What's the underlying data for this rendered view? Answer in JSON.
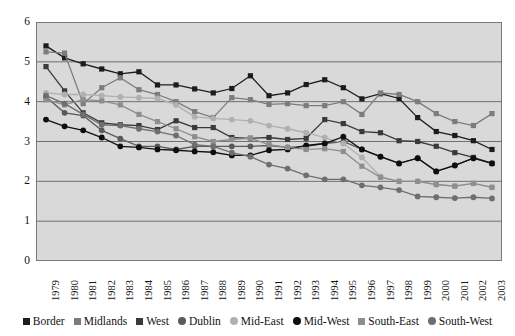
{
  "chart_data": {
    "type": "line",
    "title": "",
    "xlabel": "",
    "ylabel": "",
    "ylim": [
      0,
      6
    ],
    "yticks": [
      0,
      1,
      2,
      3,
      4,
      5,
      6
    ],
    "grid": true,
    "legend_position": "bottom",
    "x": [
      1979,
      1980,
      1981,
      1982,
      1983,
      1984,
      1985,
      1986,
      1987,
      1988,
      1989,
      1990,
      1991,
      1992,
      1993,
      1994,
      1995,
      1996,
      1997,
      1998,
      1999,
      2000,
      2001,
      2002,
      2003
    ],
    "categories": [
      "1979",
      "1980",
      "1981",
      "1982",
      "1983",
      "1984",
      "1985",
      "1986",
      "1987",
      "1988",
      "1989",
      "1990",
      "1991",
      "1992",
      "1993",
      "1994",
      "1995",
      "1996",
      "1997",
      "1998",
      "1999",
      "2000",
      "2001",
      "2002",
      "2003"
    ],
    "series": [
      {
        "name": "Border",
        "marker": "square",
        "color": "#1c1c1c",
        "values": [
          5.4,
          5.1,
          4.95,
          4.82,
          4.7,
          4.75,
          4.42,
          4.42,
          4.32,
          4.22,
          4.33,
          4.65,
          4.15,
          4.22,
          4.43,
          4.55,
          4.35,
          4.07,
          4.2,
          4.08,
          3.6,
          3.25,
          3.15,
          3.02,
          2.8
        ]
      },
      {
        "name": "Midlands",
        "marker": "square",
        "color": "#7c7c7c",
        "values": [
          5.25,
          5.22,
          3.95,
          4.35,
          4.6,
          4.3,
          4.18,
          4.0,
          3.75,
          3.6,
          4.1,
          4.05,
          3.93,
          3.95,
          3.9,
          3.9,
          4.0,
          3.68,
          4.22,
          4.18,
          4.0,
          3.7,
          3.5,
          3.4,
          3.7
        ]
      },
      {
        "name": "West",
        "marker": "square",
        "color": "#3a3a3a",
        "values": [
          4.88,
          4.27,
          3.72,
          3.47,
          3.42,
          3.4,
          3.3,
          3.52,
          3.35,
          3.35,
          3.1,
          3.08,
          3.1,
          3.05,
          3.08,
          3.55,
          3.45,
          3.25,
          3.22,
          3.02,
          3.0,
          2.88,
          2.72,
          2.6,
          2.45
        ]
      },
      {
        "name": "Dublin",
        "marker": "circle",
        "color": "#5a5a5a",
        "values": [
          4.12,
          3.72,
          3.65,
          3.28,
          3.07,
          2.88,
          2.88,
          2.8,
          2.88,
          2.88,
          2.88,
          2.88,
          2.9,
          2.85,
          2.88,
          2.95,
          3.0,
          2.8,
          2.62,
          2.45,
          2.58,
          2.25,
          2.4,
          2.58,
          2.45
        ]
      },
      {
        "name": "Mid-East",
        "marker": "circle",
        "color": "#b0b0b0",
        "values": [
          4.22,
          4.18,
          4.18,
          4.15,
          4.12,
          4.1,
          4.08,
          3.92,
          3.62,
          3.58,
          3.55,
          3.52,
          3.4,
          3.32,
          3.22,
          3.1,
          2.95,
          2.6,
          2.12,
          2.0,
          2.0,
          1.92,
          1.88,
          1.95,
          1.85
        ]
      },
      {
        "name": "Mid-West",
        "marker": "circle",
        "color": "#0e0e0e",
        "values": [
          3.55,
          3.38,
          3.28,
          3.1,
          2.88,
          2.85,
          2.8,
          2.78,
          2.75,
          2.73,
          2.65,
          2.65,
          2.78,
          2.8,
          2.9,
          2.95,
          3.12,
          2.8,
          2.62,
          2.45,
          2.58,
          2.25,
          2.4,
          2.58,
          2.45
        ]
      },
      {
        "name": "South-East",
        "marker": "square",
        "color": "#8e8e8e",
        "values": [
          4.05,
          3.92,
          4.05,
          4.02,
          3.92,
          3.68,
          3.5,
          3.32,
          3.12,
          3.0,
          3.05,
          3.08,
          2.92,
          2.85,
          2.8,
          2.82,
          2.75,
          2.38,
          2.1,
          2.0,
          2.0,
          1.92,
          1.88,
          1.95,
          1.85
        ]
      },
      {
        "name": "South-West",
        "marker": "circle",
        "color": "#6e6e6e",
        "values": [
          4.15,
          3.95,
          3.68,
          3.42,
          3.4,
          3.32,
          3.25,
          3.15,
          2.92,
          2.88,
          2.72,
          2.62,
          2.42,
          2.32,
          2.15,
          2.05,
          2.05,
          1.9,
          1.85,
          1.78,
          1.62,
          1.6,
          1.58,
          1.6,
          1.57
        ]
      }
    ]
  },
  "legend": {
    "items": [
      {
        "label": "Border",
        "marker": "square",
        "color": "#1c1c1c"
      },
      {
        "label": "Midlands",
        "marker": "square",
        "color": "#7c7c7c"
      },
      {
        "label": "West",
        "marker": "square",
        "color": "#3a3a3a"
      },
      {
        "label": "Dublin",
        "marker": "circle",
        "color": "#5a5a5a"
      },
      {
        "label": "Mid-East",
        "marker": "circle",
        "color": "#b0b0b0"
      },
      {
        "label": "Mid-West",
        "marker": "circle",
        "color": "#0e0e0e"
      },
      {
        "label": "South-East",
        "marker": "square",
        "color": "#8e8e8e"
      },
      {
        "label": "South-West",
        "marker": "circle",
        "color": "#6e6e6e"
      }
    ]
  },
  "colors": {
    "plot_background": "#d9d9d9",
    "page_background": "#ffffff",
    "gridline": "#6f6f6f",
    "axis": "#7a7a7a",
    "text": "#141414"
  }
}
